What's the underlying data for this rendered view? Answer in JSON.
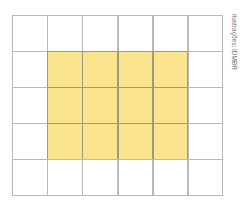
{
  "figure": {
    "columns": 6,
    "rows": 5,
    "highlight": {
      "col_start": 1,
      "col_end": 4,
      "row_start": 1,
      "row_end": 3
    },
    "highlight_cell_count": 12,
    "colors": {
      "highlight": "#fbe48e",
      "grid_line": "#b9b9b9",
      "background": "#ffffff"
    }
  },
  "credit": "Ilustrações: IDMBR"
}
